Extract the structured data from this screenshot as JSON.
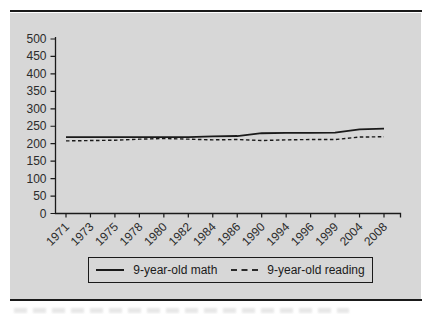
{
  "figure": {
    "colors": {
      "panel_bg": "#d7d7d7",
      "line": "#1a1a1a",
      "text": "#2b2b2b"
    }
  },
  "chart_data": {
    "type": "line",
    "categories": [
      "1971",
      "1973",
      "1975",
      "1978",
      "1980",
      "1982",
      "1984",
      "1986",
      "1990",
      "1994",
      "1996",
      "1999",
      "2004",
      "2008"
    ],
    "series": [
      {
        "name": "9-year-old math",
        "style": "solid",
        "values": [
          219,
          219,
          219,
          219,
          219,
          219,
          221,
          222,
          230,
          231,
          231,
          232,
          241,
          243
        ]
      },
      {
        "name": "9-year-old reading",
        "style": "dashed",
        "values": [
          208,
          209,
          210,
          213,
          215,
          213,
          211,
          212,
          209,
          211,
          212,
          212,
          219,
          220
        ]
      }
    ],
    "title": "",
    "xlabel": "",
    "ylabel": "",
    "ylim": [
      0,
      500
    ],
    "y_ticks": [
      0,
      50,
      100,
      150,
      200,
      250,
      300,
      350,
      400,
      450,
      500
    ],
    "grid": false,
    "legend_position": "bottom-center"
  }
}
